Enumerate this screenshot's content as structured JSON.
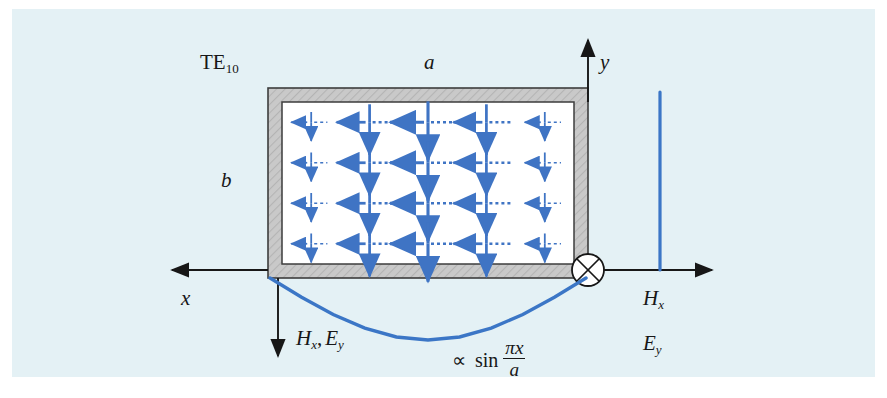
{
  "figure": {
    "background_color": "#e4f1f5",
    "page_color": "#ffffff"
  },
  "colors": {
    "field_blue": "#3f74c4",
    "curve_blue": "#3b76c6",
    "axis_black": "#171717",
    "wall_gray": "#c9c9c9",
    "wall_outline": "#3d3d3d",
    "interior_white": "#ffffff"
  },
  "labels": {
    "mode": "TE",
    "mode_sub": "10",
    "width_a": "a",
    "height_b": "b",
    "axis_y": "y",
    "axis_x": "x",
    "field_down": "H",
    "field_down_sub": "x",
    "field_down_2": "E",
    "field_down_2_sub": "y",
    "right_hx": "H",
    "right_hx_sub": "x",
    "right_ey": "E",
    "right_ey_sub": "y",
    "proportional": "∝",
    "sin": "sin",
    "sin_numerator": "πx",
    "sin_denominator": "a"
  },
  "waveguide": {
    "outer": {
      "x": 268,
      "y": 88,
      "width": 320,
      "height": 190
    },
    "wall_thickness": 14,
    "description": "Rectangular waveguide cross-section, hatched metal wall with white interior"
  },
  "chart_data": {
    "type": "line",
    "annotation": "∝ sin(πx/a)",
    "xlabel": "x",
    "ylabel": "Hx, Ey",
    "x": [
      0.0,
      0.1,
      0.2,
      0.3,
      0.4,
      0.5,
      0.6,
      0.7,
      0.8,
      0.9,
      1.0
    ],
    "values": [
      0.0,
      0.309,
      0.588,
      0.809,
      0.951,
      1.0,
      0.951,
      0.809,
      0.588,
      0.309,
      0.0
    ],
    "note": "Half-sine amplitude profile across the guide width a; plotted inverted (downward) beneath the guide."
  },
  "field_grid": {
    "columns": 5,
    "rows": 4,
    "column_amplitudes": [
      0.309,
      0.809,
      1.0,
      0.809,
      0.309
    ],
    "e_field": {
      "name": "E_y",
      "direction": "down",
      "style": "solid"
    },
    "h_field": {
      "name": "H_x",
      "direction": "left",
      "style": "dashed"
    }
  }
}
